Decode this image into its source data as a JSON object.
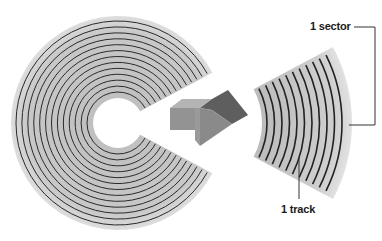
{
  "diagram": {
    "disk": {
      "center": [
        118,
        123
      ],
      "outer_radius": 107,
      "inner_radius": 25,
      "track_count": 13,
      "gap_start_deg": -28,
      "gap_end_deg": 28,
      "fill_color": "#c9c9c9",
      "edge_color": "#e4e4e4",
      "track_color": "#2a2a2a"
    },
    "arrow": {
      "direction": "right",
      "top_color": "#a8a8a8",
      "front_color": "#8e8e8e",
      "dark_color": "#5a5a5a"
    },
    "sector": {
      "center": [
        190,
        123
      ],
      "inner_radius": 72,
      "outer_radius": 162,
      "start_deg": -28,
      "end_deg": 28,
      "track_count": 11
    },
    "labels": {
      "sector": "1 sector",
      "track": "1 track"
    },
    "line_color": "#333333"
  }
}
